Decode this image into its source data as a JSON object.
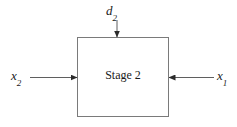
{
  "diagram": {
    "type": "block-flow-diagram",
    "background_color": "#ffffff",
    "line_color": "#6b6b6b",
    "text_color": "#1a1a1a",
    "block": {
      "label": "Stage 2",
      "x": 77,
      "y": 37,
      "width": 92,
      "height": 80,
      "border_color": "#7a7a7a",
      "fill": "#ffffff"
    },
    "signals": [
      {
        "name": "d",
        "subscript": "2",
        "direction": "down",
        "role": "disturbance-input-top",
        "label_x": 106,
        "label_y": 4,
        "arrow_from": [
          117,
          20
        ],
        "arrow_to": [
          117,
          37
        ]
      },
      {
        "name": "x",
        "subscript": "2",
        "direction": "right",
        "role": "input-left",
        "label_x": 11,
        "label_y": 69,
        "arrow_from": [
          30,
          77
        ],
        "arrow_to": [
          77,
          77
        ]
      },
      {
        "name": "x",
        "subscript": "1",
        "direction": "left",
        "role": "input-right",
        "label_x": 217,
        "label_y": 69,
        "arrow_from": [
          214,
          77
        ],
        "arrow_to": [
          169,
          77
        ]
      }
    ]
  }
}
